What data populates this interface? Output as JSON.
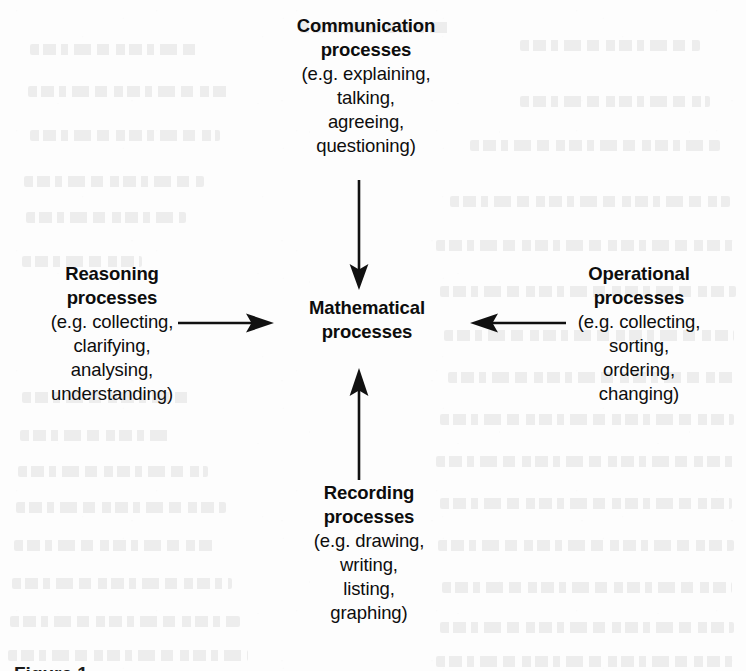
{
  "diagram": {
    "title": "Mathematical processes",
    "center": {
      "heading_lines": [
        "Mathematical",
        "processes"
      ]
    },
    "nodes": {
      "top": {
        "heading_lines": [
          "Communication",
          "processes"
        ],
        "detail_lines": [
          "(e.g. explaining,",
          "talking,",
          "agreeing,",
          "questioning)"
        ]
      },
      "left": {
        "heading_lines": [
          "Reasoning",
          "processes"
        ],
        "detail_lines": [
          "(e.g. collecting,",
          "clarifying,",
          "analysing,",
          "understanding)"
        ]
      },
      "right": {
        "heading_lines": [
          "Operational",
          "processes"
        ],
        "detail_lines": [
          "(e.g. collecting,",
          "sorting,",
          "ordering,",
          "changing)"
        ]
      },
      "bottom": {
        "heading_lines": [
          "Recording",
          "processes"
        ],
        "detail_lines": [
          "(e.g. drawing,",
          "writing,",
          "listing,",
          "graphing)"
        ]
      }
    },
    "arrows": {
      "top": "arrow-down",
      "bottom": "arrow-up",
      "left": "arrow-right",
      "right": "arrow-left"
    },
    "colors": {
      "ink": "#0d0d0d",
      "page": "#fdfdfd"
    },
    "bottom_cut_text": "Figure 1"
  }
}
